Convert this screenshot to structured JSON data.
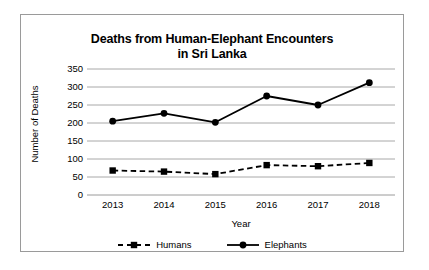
{
  "chart_data": {
    "type": "line",
    "title": "Deaths from Human-Elephant Encounters in Sri Lanka",
    "title_lines": [
      "Deaths from Human-Elephant Encounters",
      "in Sri Lanka"
    ],
    "xlabel": "Year",
    "ylabel": "Number of Deaths",
    "categories": [
      "2013",
      "2014",
      "2015",
      "2016",
      "2017",
      "2018"
    ],
    "ylim": [
      0,
      350
    ],
    "yticks": [
      0,
      50,
      100,
      150,
      200,
      250,
      300,
      350
    ],
    "ytick_labels": [
      "0",
      "50",
      "100",
      "150",
      "200",
      "250",
      "300",
      "350"
    ],
    "grid": true,
    "grid_axis": "y",
    "legend_position": "bottom",
    "series": [
      {
        "name": "Humans",
        "values": [
          68,
          65,
          58,
          83,
          80,
          89
        ],
        "line_style": "dashed",
        "marker": "square",
        "color": "#000000"
      },
      {
        "name": "Elephants",
        "values": [
          205,
          227,
          202,
          275,
          250,
          312
        ],
        "line_style": "solid",
        "marker": "circle",
        "color": "#000000"
      }
    ]
  },
  "colors": {
    "frame_border": "#9a9a9a",
    "gridline": "#a8a8a8",
    "axis_line": "#9a9a9a",
    "series_line": "#000000",
    "text": "#000000",
    "background": "#ffffff"
  }
}
